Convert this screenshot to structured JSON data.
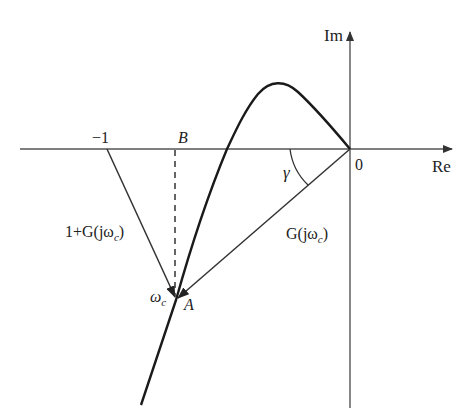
{
  "diagram": {
    "type": "nyquist-phase-margin",
    "axes": {
      "real_label": "Re",
      "imag_label": "Im",
      "origin_label": "0"
    },
    "points": {
      "minus_one": "−1",
      "B": "B",
      "A": "A",
      "omega_c": "ω",
      "omega_c_sub": "c"
    },
    "vectors": {
      "G_label_main": "G(jω",
      "G_label_sub": "c",
      "G_label_close": ")",
      "one_plus_G_main": "1+G(jω",
      "one_plus_G_sub": "c",
      "one_plus_G_close": ")"
    },
    "angle": {
      "gamma": "γ"
    },
    "colors": {
      "curve": "#1a1a1a",
      "axis": "#555555",
      "vector": "#333333",
      "background": "#ffffff"
    }
  }
}
